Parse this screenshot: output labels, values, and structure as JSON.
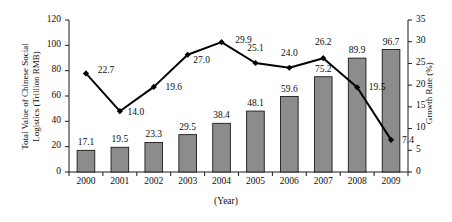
{
  "chart_data": {
    "type": "bar",
    "title": "",
    "xlabel": "(Year)",
    "categories": [
      "2000",
      "2001",
      "2002",
      "2003",
      "2004",
      "2005",
      "2006",
      "2007",
      "2008",
      "2009"
    ],
    "grid": false,
    "legend_position": "none",
    "series": [
      {
        "name": "Total Value of Chinese Social Logistics (Trillion RMB)",
        "type": "bar",
        "axis": "left",
        "values": [
          17.1,
          19.5,
          23.3,
          29.5,
          38.4,
          48.1,
          59.6,
          75.2,
          89.9,
          96.7
        ],
        "labels": [
          "17.1",
          "19.5",
          "23.3",
          "29.5",
          "38.4",
          "48.1",
          "59.6",
          "75.2",
          "89.9",
          "96.7"
        ],
        "color": "#8c8c8c",
        "border_color": "#1a1a1a"
      },
      {
        "name": "Growth Rate (%)",
        "type": "line",
        "axis": "right",
        "values": [
          22.7,
          14.0,
          19.6,
          27.0,
          29.9,
          25.1,
          24.0,
          26.2,
          19.5,
          7.4
        ],
        "labels": [
          "22.7",
          "14.0",
          "19.6",
          "27.0",
          "29.9",
          "25.1",
          "24.0",
          "26.2",
          "19.5",
          "7.4"
        ],
        "color": "#000000",
        "marker": "diamond"
      }
    ],
    "left_axis": {
      "label_lines": [
        "Total Value of Chinese Social",
        "Logistics (Trillion RMB)"
      ],
      "ticks": [
        "0",
        "20",
        "40",
        "60",
        "80",
        "100",
        "120"
      ],
      "min": 0,
      "max": 120
    },
    "right_axis": {
      "label": "Growth Rate (%)",
      "ticks": [
        "0",
        "5",
        "10",
        "15",
        "20",
        "25",
        "30",
        "35"
      ],
      "min": 0,
      "max": 35
    }
  }
}
